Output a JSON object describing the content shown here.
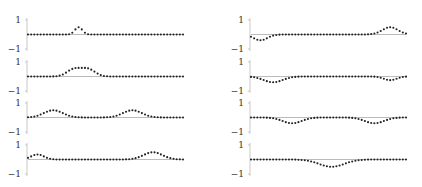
{
  "chart_data": [
    {
      "type": "scatter",
      "panel": "left-1",
      "ylim": [
        -1,
        1
      ],
      "yticks": [
        "1",
        "−1"
      ],
      "peaks": [
        {
          "center": 16,
          "width": 1.2,
          "amp": 0.5
        }
      ]
    },
    {
      "type": "scatter",
      "panel": "left-2",
      "ylim": [
        -1,
        1
      ],
      "yticks": [
        "1",
        "−1"
      ],
      "peaks": [
        {
          "center": 14.5,
          "width": 2.2,
          "amp": 0.5
        },
        {
          "center": 19,
          "width": 2.2,
          "amp": 0.5
        }
      ]
    },
    {
      "type": "scatter",
      "panel": "left-3",
      "ylim": [
        -1,
        1
      ],
      "yticks": [
        "1",
        "−1"
      ],
      "peaks": [
        {
          "center": 8,
          "width": 3,
          "amp": 0.5
        },
        {
          "center": 33,
          "width": 3,
          "amp": 0.5
        }
      ]
    },
    {
      "type": "scatter",
      "panel": "left-4",
      "ylim": [
        -1,
        1
      ],
      "yticks": [
        "1",
        "−1"
      ],
      "peaks": [
        {
          "center": 3,
          "width": 2,
          "amp": 0.35
        },
        {
          "center": 39.5,
          "width": 3,
          "amp": 0.5
        }
      ]
    },
    {
      "type": "scatter",
      "panel": "right-1",
      "ylim": [
        -1,
        1
      ],
      "yticks": [
        "1",
        "−1"
      ],
      "peaks": [
        {
          "center": 3,
          "width": 2.2,
          "amp": -0.4
        },
        {
          "center": 44,
          "width": 2.5,
          "amp": 0.5
        }
      ]
    },
    {
      "type": "scatter",
      "panel": "right-2",
      "ylim": [
        -1,
        1
      ],
      "yticks": [
        "1",
        "−1"
      ],
      "peaks": [
        {
          "center": 7,
          "width": 3,
          "amp": -0.4
        },
        {
          "center": 44,
          "width": 2,
          "amp": -0.25
        }
      ]
    },
    {
      "type": "scatter",
      "panel": "right-3",
      "ylim": [
        -1,
        1
      ],
      "yticks": [
        "1",
        "−1"
      ],
      "peaks": [
        {
          "center": 13,
          "width": 3,
          "amp": -0.4
        },
        {
          "center": 39,
          "width": 3,
          "amp": -0.4
        }
      ]
    },
    {
      "type": "scatter",
      "panel": "right-4",
      "ylim": [
        -1,
        1
      ],
      "yticks": [
        "1",
        "−1"
      ],
      "peaks": [
        {
          "center": 25.5,
          "width": 4,
          "amp": -0.5
        }
      ]
    }
  ],
  "n_points": 50,
  "grid": false
}
